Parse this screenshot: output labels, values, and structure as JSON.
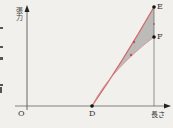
{
  "diagram": {
    "y_axis_label": "張力",
    "x_axis_label": "長さ",
    "origin_label": "O",
    "points": [
      {
        "name": "D",
        "x": 92,
        "y": 106
      },
      {
        "name": "E",
        "x": 154,
        "y": 7
      },
      {
        "name": "F",
        "x": 154,
        "y": 37
      }
    ],
    "colors": {
      "curve": "#d06a6a",
      "fill": "#a9a9a9",
      "axis": "#444444",
      "background": "#f1f0ec"
    }
  }
}
